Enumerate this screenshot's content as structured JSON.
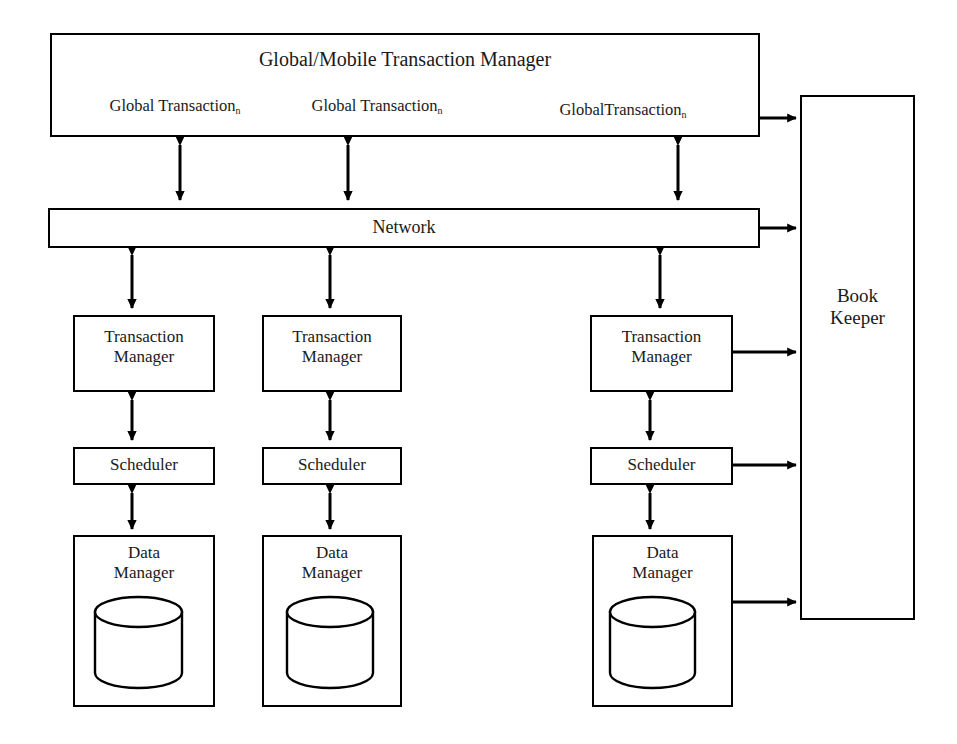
{
  "diagram": {
    "title_box": {
      "title": "Global/Mobile Transaction Manager",
      "transactions": [
        {
          "name": "Global Transaction",
          "subscript": "n"
        },
        {
          "name": "Global Transaction",
          "subscript": "n"
        },
        {
          "name": "GlobalTransaction",
          "subscript": "n"
        }
      ]
    },
    "network": {
      "label": "Network"
    },
    "bookkeeper": {
      "label": "Book\nKeeper"
    },
    "columns": [
      {
        "transaction_manager": "Transaction\nManager",
        "scheduler": "Scheduler",
        "data_manager": "Data\nManager",
        "database_icon": "database-cylinder"
      },
      {
        "transaction_manager": "Transaction\nManager",
        "scheduler": "Scheduler",
        "data_manager": "Data\nManager",
        "database_icon": "database-cylinder"
      },
      {
        "transaction_manager": "Transaction\nManager",
        "scheduler": "Scheduler",
        "data_manager": "Data\nManager",
        "database_icon": "database-cylinder"
      }
    ],
    "colors": {
      "stroke": "#000000",
      "background": "#ffffff",
      "text": "#1a1a1a"
    }
  }
}
